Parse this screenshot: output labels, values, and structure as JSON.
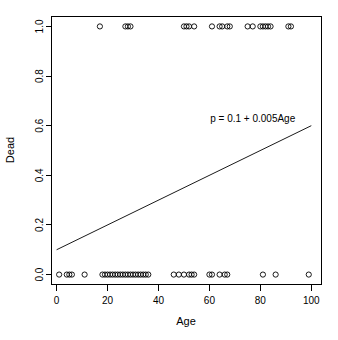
{
  "chart_data": {
    "type": "scatter",
    "title": "",
    "subtitle": "",
    "xlabel": "Age",
    "ylabel": "Dead",
    "xlim": [
      -2,
      104
    ],
    "ylim": [
      -0.04,
      1.04
    ],
    "xticks": [
      0,
      20,
      40,
      60,
      80,
      100
    ],
    "yticks": [
      "0.0",
      "0.2",
      "0.4",
      "0.6",
      "0.8",
      "1.0"
    ],
    "ytick_values": [
      0.0,
      0.2,
      0.4,
      0.6,
      0.8,
      1.0
    ],
    "grid": false,
    "legend": "none",
    "point_marker": "open-circle",
    "annotations": [
      {
        "text": "p = 0.1 + 0.005Age",
        "x": 77,
        "y": 0.615
      }
    ],
    "series": [
      {
        "name": "Dead vs Age",
        "type": "scatter",
        "x": [
          1,
          4,
          5,
          6,
          11,
          18,
          19,
          20,
          21,
          22,
          23,
          24,
          25,
          26,
          27,
          28,
          29,
          30,
          31,
          32,
          33,
          34,
          35,
          36,
          46,
          48,
          50,
          52,
          53,
          54,
          60,
          61,
          64,
          66,
          67,
          81,
          86,
          99,
          17,
          27,
          28,
          29,
          50,
          51,
          52,
          54,
          61,
          64,
          65,
          67,
          68,
          75,
          77,
          80,
          81,
          82,
          83,
          84,
          91,
          92
        ],
        "y": [
          0,
          0,
          0,
          0,
          0,
          0,
          0,
          0,
          0,
          0,
          0,
          0,
          0,
          0,
          0,
          0,
          0,
          0,
          0,
          0,
          0,
          0,
          0,
          0,
          0,
          0,
          0,
          0,
          0,
          0,
          0,
          0,
          0,
          0,
          0,
          0,
          0,
          0,
          1,
          1,
          1,
          1,
          1,
          1,
          1,
          1,
          1,
          1,
          1,
          1,
          1,
          1,
          1,
          1,
          1,
          1,
          1,
          1,
          1,
          1
        ]
      }
    ],
    "fit_line": {
      "name": "linear probability fit",
      "equation": "p = 0.1 + 0.005Age",
      "intercept": 0.1,
      "slope": 0.005,
      "x_start": 0,
      "x_end": 100,
      "y_start": 0.1,
      "y_end": 0.6
    }
  }
}
